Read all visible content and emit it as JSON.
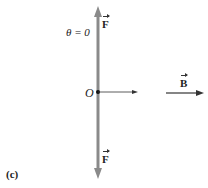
{
  "figure": {
    "panel_label": "(c)",
    "angle_label": "θ = 0",
    "origin_label": "O",
    "force_top_label": "F",
    "force_bottom_label": "F",
    "field_label": "B",
    "colors": {
      "force_axis": "#8a8a8a",
      "arrow": "#333333",
      "text": "#222222"
    }
  }
}
